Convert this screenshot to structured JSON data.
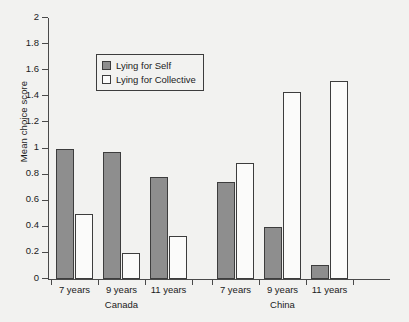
{
  "chart_data": {
    "type": "bar",
    "title": "",
    "xlabel": "",
    "ylabel": "Mean choice score",
    "ylim": [
      0,
      2
    ],
    "ytick_values": [
      0,
      0.2,
      0.4,
      0.6,
      0.8,
      1,
      1.2,
      1.4,
      1.6,
      1.8,
      2
    ],
    "ytick_labels": [
      "0",
      "0.2",
      "0.4",
      "0.6",
      "0.8",
      "1",
      "1.2",
      "1.4",
      "1.6",
      "1.8",
      "2"
    ],
    "grid": false,
    "legend_position": "upper-left-inside",
    "categories": [
      "7 years",
      "9 years",
      "11 years",
      "7 years",
      "9 years",
      "11 years"
    ],
    "groups": [
      {
        "label": "Canada",
        "categories": [
          "7 years",
          "9 years",
          "11 years"
        ]
      },
      {
        "label": "China",
        "categories": [
          "7 years",
          "9 years",
          "11 years"
        ]
      }
    ],
    "series": [
      {
        "name": "Lying for Self",
        "color": "#8e8e8e",
        "values": [
          1.0,
          0.97,
          0.78,
          0.74,
          0.4,
          0.11
        ]
      },
      {
        "name": "Lying for Collective",
        "color": "#fbfbfa",
        "values": [
          0.5,
          0.2,
          0.33,
          0.89,
          1.43,
          1.52
        ]
      }
    ],
    "bars": [
      {
        "group": "Canada",
        "category": "7 years",
        "series": "Lying for Self",
        "value": 1.0
      },
      {
        "group": "Canada",
        "category": "7 years",
        "series": "Lying for Collective",
        "value": 0.5
      },
      {
        "group": "Canada",
        "category": "9 years",
        "series": "Lying for Self",
        "value": 0.97
      },
      {
        "group": "Canada",
        "category": "9 years",
        "series": "Lying for Collective",
        "value": 0.2
      },
      {
        "group": "Canada",
        "category": "11 years",
        "series": "Lying for Self",
        "value": 0.78
      },
      {
        "group": "Canada",
        "category": "11 years",
        "series": "Lying for Collective",
        "value": 0.33
      },
      {
        "group": "China",
        "category": "7 years",
        "series": "Lying for Self",
        "value": 0.74
      },
      {
        "group": "China",
        "category": "7 years",
        "series": "Lying for Collective",
        "value": 0.89
      },
      {
        "group": "China",
        "category": "9 years",
        "series": "Lying for Self",
        "value": 0.4
      },
      {
        "group": "China",
        "category": "9 years",
        "series": "Lying for Collective",
        "value": 1.43
      },
      {
        "group": "China",
        "category": "11 years",
        "series": "Lying for Self",
        "value": 0.11
      },
      {
        "group": "China",
        "category": "11 years",
        "series": "Lying for Collective",
        "value": 1.52
      }
    ]
  },
  "legend": {
    "items": [
      {
        "label": "Lying for Self",
        "swatch": "self"
      },
      {
        "label": "Lying for Collective",
        "swatch": "collective"
      }
    ]
  },
  "colors": {
    "background": "#f2f2f0",
    "axis": "#4a4a4a",
    "text": "#1b1b1b",
    "bar_self_fill": "#8e8e8e",
    "bar_collective_fill": "#fbfbfa",
    "bar_border": "#3d3d3d"
  }
}
